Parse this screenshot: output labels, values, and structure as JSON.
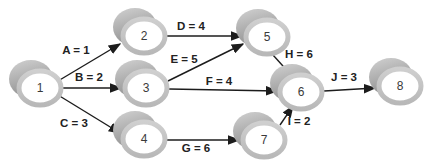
{
  "diagram": {
    "kind": "activity-network",
    "background": "#ffffff",
    "colors": {
      "node_back_light": "#d0d0d0",
      "node_back_dark": "#8f8f8f",
      "node_ring": "#c6c6c6",
      "node_face": "#ffffff",
      "edge": "#1c1c1c",
      "label_text": "#222222",
      "node_text": "#3a3a3a"
    },
    "nodes": [
      {
        "id": "1"
      },
      {
        "id": "2"
      },
      {
        "id": "3"
      },
      {
        "id": "4"
      },
      {
        "id": "5"
      },
      {
        "id": "6"
      },
      {
        "id": "7"
      },
      {
        "id": "8"
      }
    ],
    "edges": [
      {
        "from": "1",
        "to": "2",
        "activity": "A",
        "duration": 1,
        "label": "A = 1"
      },
      {
        "from": "1",
        "to": "3",
        "activity": "B",
        "duration": 2,
        "label": "B = 2"
      },
      {
        "from": "1",
        "to": "4",
        "activity": "C",
        "duration": 3,
        "label": "C = 3"
      },
      {
        "from": "2",
        "to": "5",
        "activity": "D",
        "duration": 4,
        "label": "D = 4"
      },
      {
        "from": "3",
        "to": "5",
        "activity": "E",
        "duration": 5,
        "label": "E = 5"
      },
      {
        "from": "3",
        "to": "6",
        "activity": "F",
        "duration": 4,
        "label": "F = 4"
      },
      {
        "from": "4",
        "to": "7",
        "activity": "G",
        "duration": 6,
        "label": "G = 6"
      },
      {
        "from": "5",
        "to": "6",
        "activity": "H",
        "duration": 6,
        "label": "H = 6"
      },
      {
        "from": "7",
        "to": "6",
        "activity": "I",
        "duration": 2,
        "label": "I = 2"
      },
      {
        "from": "6",
        "to": "8",
        "activity": "J",
        "duration": 3,
        "label": "J = 3"
      }
    ]
  }
}
